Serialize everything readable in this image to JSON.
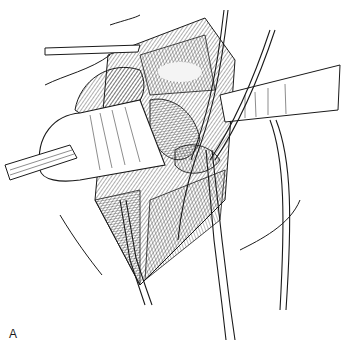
{
  "figure": {
    "panel_label": "A",
    "colors": {
      "ink": "#1a1a1a",
      "background": "#ffffff",
      "highlight": "#f4f4f4"
    }
  }
}
